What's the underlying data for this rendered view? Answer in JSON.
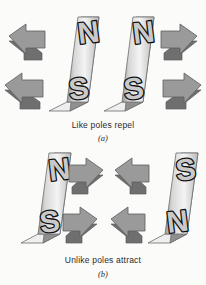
{
  "figure": {
    "background_color": "#fbfbfa"
  },
  "panels": [
    {
      "id": "a",
      "caption": "Like poles repel",
      "label": "(a)",
      "magnets": [
        {
          "name": "left-magnet",
          "top_pole": "N",
          "bottom_pole": "S"
        },
        {
          "name": "right-magnet",
          "top_pole": "N",
          "bottom_pole": "S"
        }
      ],
      "arrows": [
        {
          "name": "arrow-top-left",
          "direction": "left"
        },
        {
          "name": "arrow-top-right",
          "direction": "right"
        },
        {
          "name": "arrow-bottom-left",
          "direction": "left"
        },
        {
          "name": "arrow-bottom-right",
          "direction": "right"
        }
      ]
    },
    {
      "id": "b",
      "caption": "Unlike poles attract",
      "label": "(b)",
      "magnets": [
        {
          "name": "left-magnet",
          "top_pole": "N",
          "bottom_pole": "S"
        },
        {
          "name": "right-magnet",
          "top_pole": "S",
          "bottom_pole": "N"
        }
      ],
      "arrows": [
        {
          "name": "arrow-top-left",
          "direction": "right"
        },
        {
          "name": "arrow-top-right",
          "direction": "left"
        },
        {
          "name": "arrow-bottom-left",
          "direction": "right"
        },
        {
          "name": "arrow-bottom-right",
          "direction": "left"
        }
      ]
    }
  ],
  "colors": {
    "magnet_face_light": "#f2f2f2",
    "magnet_face_dark": "#8e8e8e",
    "magnet_edge": "#6d6d6d",
    "arrow_face": "#9a9a9a",
    "arrow_shade": "#6f6f6f",
    "pole_letter_outline": "#111111",
    "text": "#2a2a2a"
  }
}
